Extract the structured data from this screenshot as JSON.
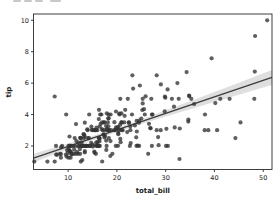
{
  "figure": {
    "background": "#ffffff",
    "fragment_color": "#c8c8c8"
  },
  "chart_data": {
    "type": "scatter",
    "title": "",
    "xlabel": "total_bill",
    "ylabel": "tip",
    "xlim": [
      2.9,
      51.8
    ],
    "ylim": [
      0.5,
      10.4
    ],
    "x_ticks": [
      10,
      20,
      30,
      40,
      50
    ],
    "y_ticks": [
      2,
      4,
      6,
      8,
      10
    ],
    "grid": false,
    "legend": "none",
    "marker_color": "#333333",
    "marker_alpha": 0.78,
    "marker_radius": 2.1,
    "line_color": "#3d3d3d",
    "line_width": 1.4,
    "band_color": "#d9d9d9",
    "spine_color": "#2b2b2b",
    "regression": {
      "slope": 0.10502,
      "intercept": 0.92027
    },
    "band": [
      {
        "x": 2.9,
        "lo": 0.95,
        "hi": 1.5
      },
      {
        "x": 5,
        "lo": 1.2,
        "hi": 1.69
      },
      {
        "x": 10,
        "lo": 1.78,
        "hi": 2.16
      },
      {
        "x": 15,
        "lo": 2.35,
        "hi": 2.64
      },
      {
        "x": 20,
        "lo": 2.89,
        "hi": 3.15
      },
      {
        "x": 25,
        "lo": 3.4,
        "hi": 3.69
      },
      {
        "x": 30,
        "lo": 3.88,
        "hi": 4.27
      },
      {
        "x": 35,
        "lo": 4.34,
        "hi": 4.85
      },
      {
        "x": 40,
        "lo": 4.8,
        "hi": 5.44
      },
      {
        "x": 45,
        "lo": 5.26,
        "hi": 6.03
      },
      {
        "x": 50,
        "lo": 5.72,
        "hi": 6.63
      },
      {
        "x": 51.8,
        "lo": 5.88,
        "hi": 6.84
      }
    ],
    "points": [
      [
        16.99,
        1.01
      ],
      [
        10.34,
        1.66
      ],
      [
        21.01,
        3.5
      ],
      [
        23.68,
        3.31
      ],
      [
        24.59,
        3.61
      ],
      [
        25.29,
        4.71
      ],
      [
        8.77,
        2.0
      ],
      [
        26.88,
        3.12
      ],
      [
        15.04,
        1.96
      ],
      [
        14.78,
        3.23
      ],
      [
        10.27,
        1.71
      ],
      [
        35.26,
        5.0
      ],
      [
        15.42,
        1.57
      ],
      [
        18.43,
        3.0
      ],
      [
        14.83,
        3.02
      ],
      [
        21.58,
        3.92
      ],
      [
        10.33,
        1.67
      ],
      [
        16.29,
        3.71
      ],
      [
        16.97,
        3.5
      ],
      [
        20.65,
        3.35
      ],
      [
        17.92,
        4.08
      ],
      [
        20.29,
        2.75
      ],
      [
        15.77,
        2.23
      ],
      [
        39.42,
        7.58
      ],
      [
        19.82,
        3.18
      ],
      [
        17.81,
        2.34
      ],
      [
        13.37,
        2.0
      ],
      [
        12.69,
        2.0
      ],
      [
        21.7,
        4.3
      ],
      [
        19.65,
        3.0
      ],
      [
        9.55,
        1.45
      ],
      [
        18.35,
        2.5
      ],
      [
        15.06,
        3.0
      ],
      [
        20.69,
        2.45
      ],
      [
        17.78,
        3.27
      ],
      [
        24.06,
        3.6
      ],
      [
        16.31,
        2.0
      ],
      [
        16.93,
        3.07
      ],
      [
        18.69,
        2.31
      ],
      [
        31.27,
        5.0
      ],
      [
        16.04,
        2.24
      ],
      [
        17.46,
        2.54
      ],
      [
        13.94,
        3.06
      ],
      [
        9.68,
        1.32
      ],
      [
        30.4,
        5.6
      ],
      [
        18.29,
        3.0
      ],
      [
        22.23,
        5.0
      ],
      [
        32.4,
        6.0
      ],
      [
        28.55,
        2.05
      ],
      [
        18.04,
        3.0
      ],
      [
        12.54,
        2.5
      ],
      [
        10.29,
        2.6
      ],
      [
        34.81,
        5.2
      ],
      [
        9.94,
        1.56
      ],
      [
        25.56,
        4.34
      ],
      [
        19.49,
        3.51
      ],
      [
        38.01,
        3.0
      ],
      [
        26.41,
        1.5
      ],
      [
        11.24,
        1.76
      ],
      [
        48.27,
        6.73
      ],
      [
        20.29,
        3.21
      ],
      [
        13.81,
        2.0
      ],
      [
        11.02,
        1.98
      ],
      [
        18.29,
        3.76
      ],
      [
        17.59,
        2.64
      ],
      [
        20.08,
        3.15
      ],
      [
        16.45,
        2.47
      ],
      [
        3.07,
        1.0
      ],
      [
        20.23,
        2.01
      ],
      [
        15.01,
        2.09
      ],
      [
        12.02,
        1.97
      ],
      [
        17.07,
        3.0
      ],
      [
        26.86,
        3.14
      ],
      [
        25.28,
        5.0
      ],
      [
        14.73,
        2.2
      ],
      [
        10.51,
        1.25
      ],
      [
        17.92,
        3.08
      ],
      [
        27.2,
        4.0
      ],
      [
        22.76,
        3.0
      ],
      [
        17.29,
        2.71
      ],
      [
        19.44,
        3.0
      ],
      [
        16.66,
        3.4
      ],
      [
        10.07,
        1.83
      ],
      [
        32.68,
        5.0
      ],
      [
        15.98,
        2.03
      ],
      [
        34.83,
        5.17
      ],
      [
        13.03,
        2.0
      ],
      [
        18.28,
        4.0
      ],
      [
        24.71,
        5.85
      ],
      [
        21.16,
        3.0
      ],
      [
        28.97,
        3.0
      ],
      [
        22.49,
        3.5
      ],
      [
        5.75,
        1.0
      ],
      [
        16.32,
        4.3
      ],
      [
        22.75,
        3.25
      ],
      [
        40.17,
        4.73
      ],
      [
        27.28,
        4.0
      ],
      [
        12.03,
        1.5
      ],
      [
        21.01,
        3.0
      ],
      [
        12.46,
        1.5
      ],
      [
        11.35,
        2.5
      ],
      [
        15.38,
        3.0
      ],
      [
        44.3,
        2.5
      ],
      [
        22.42,
        3.48
      ],
      [
        20.92,
        4.08
      ],
      [
        15.36,
        1.64
      ],
      [
        20.49,
        4.06
      ],
      [
        25.21,
        4.29
      ],
      [
        18.24,
        3.76
      ],
      [
        14.31,
        4.0
      ],
      [
        14.0,
        3.0
      ],
      [
        7.25,
        1.0
      ],
      [
        38.07,
        4.0
      ],
      [
        23.95,
        2.55
      ],
      [
        25.71,
        4.0
      ],
      [
        17.31,
        3.5
      ],
      [
        29.93,
        5.07
      ],
      [
        10.65,
        1.5
      ],
      [
        12.43,
        1.8
      ],
      [
        24.08,
        2.92
      ],
      [
        11.69,
        2.31
      ],
      [
        13.42,
        1.68
      ],
      [
        14.26,
        2.5
      ],
      [
        15.95,
        2.0
      ],
      [
        12.48,
        2.52
      ],
      [
        29.8,
        4.2
      ],
      [
        8.52,
        1.48
      ],
      [
        14.52,
        2.0
      ],
      [
        11.38,
        2.0
      ],
      [
        22.82,
        2.18
      ],
      [
        19.08,
        1.5
      ],
      [
        20.27,
        2.83
      ],
      [
        11.17,
        1.5
      ],
      [
        12.26,
        2.0
      ],
      [
        18.26,
        3.25
      ],
      [
        8.51,
        1.25
      ],
      [
        10.33,
        2.0
      ],
      [
        14.15,
        2.0
      ],
      [
        16.0,
        2.0
      ],
      [
        13.16,
        2.75
      ],
      [
        17.47,
        3.5
      ],
      [
        34.3,
        6.7
      ],
      [
        41.19,
        5.0
      ],
      [
        27.05,
        5.0
      ],
      [
        16.43,
        2.3
      ],
      [
        8.35,
        1.5
      ],
      [
        18.64,
        1.36
      ],
      [
        11.87,
        1.63
      ],
      [
        9.78,
        1.73
      ],
      [
        7.51,
        2.0
      ],
      [
        14.07,
        2.5
      ],
      [
        13.13,
        2.0
      ],
      [
        17.26,
        2.74
      ],
      [
        24.55,
        2.0
      ],
      [
        19.77,
        2.0
      ],
      [
        29.85,
        5.14
      ],
      [
        48.17,
        5.0
      ],
      [
        25.0,
        3.75
      ],
      [
        13.39,
        2.61
      ],
      [
        16.49,
        2.0
      ],
      [
        21.5,
        3.5
      ],
      [
        12.66,
        2.5
      ],
      [
        16.21,
        2.0
      ],
      [
        13.81,
        2.0
      ],
      [
        17.51,
        3.0
      ],
      [
        24.52,
        3.48
      ],
      [
        20.76,
        2.24
      ],
      [
        31.71,
        4.5
      ],
      [
        10.59,
        1.61
      ],
      [
        10.63,
        2.0
      ],
      [
        50.81,
        10.0
      ],
      [
        15.81,
        3.16
      ],
      [
        7.25,
        5.15
      ],
      [
        31.85,
        3.18
      ],
      [
        16.82,
        4.0
      ],
      [
        32.9,
        3.11
      ],
      [
        17.89,
        2.0
      ],
      [
        14.48,
        2.0
      ],
      [
        9.6,
        4.0
      ],
      [
        34.63,
        3.55
      ],
      [
        34.65,
        3.68
      ],
      [
        23.33,
        5.65
      ],
      [
        45.35,
        3.5
      ],
      [
        23.17,
        6.5
      ],
      [
        40.55,
        3.0
      ],
      [
        20.69,
        5.0
      ],
      [
        20.9,
        3.5
      ],
      [
        30.46,
        2.0
      ],
      [
        18.15,
        3.5
      ],
      [
        23.1,
        4.0
      ],
      [
        15.69,
        1.5
      ],
      [
        19.81,
        4.19
      ],
      [
        28.44,
        2.56
      ],
      [
        15.48,
        2.02
      ],
      [
        16.58,
        4.0
      ],
      [
        7.56,
        1.44
      ],
      [
        10.34,
        2.0
      ],
      [
        43.11,
        5.0
      ],
      [
        13.0,
        2.0
      ],
      [
        13.51,
        2.0
      ],
      [
        18.71,
        4.0
      ],
      [
        12.74,
        2.01
      ],
      [
        13.0,
        2.0
      ],
      [
        16.4,
        2.5
      ],
      [
        20.53,
        4.0
      ],
      [
        16.47,
        3.23
      ],
      [
        26.59,
        3.41
      ],
      [
        38.73,
        3.0
      ],
      [
        24.27,
        2.03
      ],
      [
        12.76,
        2.23
      ],
      [
        30.06,
        2.0
      ],
      [
        25.89,
        5.16
      ],
      [
        48.33,
        9.0
      ],
      [
        13.27,
        2.5
      ],
      [
        28.17,
        6.5
      ],
      [
        12.9,
        1.1
      ],
      [
        28.15,
        3.0
      ],
      [
        11.59,
        1.5
      ],
      [
        7.74,
        1.44
      ],
      [
        30.14,
        3.09
      ],
      [
        12.16,
        2.2
      ],
      [
        13.42,
        3.48
      ],
      [
        8.58,
        1.92
      ],
      [
        15.98,
        3.0
      ],
      [
        13.42,
        1.58
      ],
      [
        16.27,
        2.5
      ],
      [
        10.09,
        2.0
      ],
      [
        20.45,
        3.0
      ],
      [
        13.28,
        2.72
      ],
      [
        22.12,
        2.88
      ],
      [
        24.01,
        2.0
      ],
      [
        15.69,
        3.0
      ],
      [
        11.61,
        3.39
      ],
      [
        10.77,
        1.47
      ],
      [
        15.53,
        3.0
      ],
      [
        10.07,
        1.25
      ],
      [
        12.6,
        1.0
      ],
      [
        32.83,
        1.17
      ],
      [
        35.83,
        4.67
      ],
      [
        29.03,
        5.92
      ],
      [
        27.18,
        2.0
      ],
      [
        22.67,
        2.0
      ],
      [
        17.82,
        1.75
      ],
      [
        18.78,
        3.0
      ]
    ]
  }
}
